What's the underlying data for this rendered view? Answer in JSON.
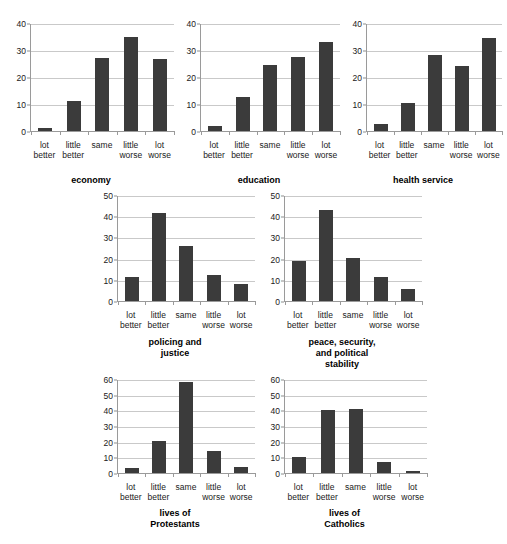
{
  "figure": {
    "background_color": "#ffffff",
    "bar_color": "#3b3b3b",
    "grid_color": "#c9c9c9",
    "axis_color": "#9a9a9a"
  },
  "chart_data": [
    {
      "id": "economy",
      "type": "bar",
      "title": "economy",
      "title_lines": [
        "economy"
      ],
      "categories": [
        "lot better",
        "little better",
        "same",
        "little worse",
        "lot worse"
      ],
      "category_lines": [
        [
          "lot",
          "better"
        ],
        [
          "little",
          "better"
        ],
        [
          "same"
        ],
        [
          "little",
          "worse"
        ],
        [
          "lot",
          "worse"
        ]
      ],
      "values": [
        1,
        11,
        27,
        35,
        26.5
      ],
      "xlabel": "",
      "ylabel": "",
      "ylim": [
        0,
        40
      ],
      "yticks": [
        0,
        10,
        20,
        30,
        40
      ],
      "grid": true,
      "legend": "none"
    },
    {
      "id": "education",
      "type": "bar",
      "title": "education",
      "title_lines": [
        "education"
      ],
      "categories": [
        "lot better",
        "little better",
        "same",
        "little worse",
        "lot worse"
      ],
      "category_lines": [
        [
          "lot",
          "better"
        ],
        [
          "little",
          "better"
        ],
        [
          "same"
        ],
        [
          "little",
          "worse"
        ],
        [
          "lot",
          "worse"
        ]
      ],
      "values": [
        2,
        12.5,
        24.5,
        27.5,
        33
      ],
      "xlabel": "",
      "ylabel": "",
      "ylim": [
        0,
        40
      ],
      "yticks": [
        0,
        10,
        20,
        30,
        40
      ],
      "grid": true,
      "legend": "none"
    },
    {
      "id": "health-service",
      "type": "bar",
      "title": "health service",
      "title_lines": [
        "health service"
      ],
      "categories": [
        "lot better",
        "little better",
        "same",
        "little worse",
        "lot worse"
      ],
      "category_lines": [
        [
          "lot",
          "better"
        ],
        [
          "little",
          "better"
        ],
        [
          "same"
        ],
        [
          "little",
          "worse"
        ],
        [
          "lot",
          "worse"
        ]
      ],
      "values": [
        2.5,
        10.5,
        28,
        24,
        34.5
      ],
      "xlabel": "",
      "ylabel": "",
      "ylim": [
        0,
        40
      ],
      "yticks": [
        0,
        10,
        20,
        30,
        40
      ],
      "grid": true,
      "legend": "none"
    },
    {
      "id": "policing-and-justice",
      "type": "bar",
      "title": "policing and justice",
      "title_lines": [
        "policing and",
        "justice"
      ],
      "categories": [
        "lot better",
        "little better",
        "same",
        "little worse",
        "lot worse"
      ],
      "category_lines": [
        [
          "lot",
          "better"
        ],
        [
          "little",
          "better"
        ],
        [
          "same"
        ],
        [
          "little",
          "worse"
        ],
        [
          "lot",
          "worse"
        ]
      ],
      "values": [
        11.5,
        41.5,
        26,
        12.5,
        8
      ],
      "xlabel": "",
      "ylabel": "",
      "ylim": [
        0,
        50
      ],
      "yticks": [
        0,
        10,
        20,
        30,
        40,
        50
      ],
      "grid": true,
      "legend": "none"
    },
    {
      "id": "peace-security-and-political-stability",
      "type": "bar",
      "title": "peace, security, and political stability",
      "title_lines": [
        "peace, security,",
        "and political",
        "stability"
      ],
      "categories": [
        "lot better",
        "little better",
        "same",
        "little worse",
        "lot worse"
      ],
      "category_lines": [
        [
          "lot",
          "better"
        ],
        [
          "little",
          "better"
        ],
        [
          "same"
        ],
        [
          "little",
          "worse"
        ],
        [
          "lot",
          "worse"
        ]
      ],
      "values": [
        19,
        43,
        20.5,
        11.5,
        5.5
      ],
      "xlabel": "",
      "ylabel": "",
      "ylim": [
        0,
        50
      ],
      "yticks": [
        0,
        10,
        20,
        30,
        40,
        50
      ],
      "grid": true,
      "legend": "none"
    },
    {
      "id": "lives-of-protestants",
      "type": "bar",
      "title": "lives of Protestants",
      "title_lines": [
        "lives of",
        "Protestants"
      ],
      "categories": [
        "lot better",
        "little better",
        "same",
        "little worse",
        "lot worse"
      ],
      "category_lines": [
        [
          "lot",
          "better"
        ],
        [
          "little",
          "better"
        ],
        [
          "same"
        ],
        [
          "little",
          "worse"
        ],
        [
          "lot",
          "worse"
        ]
      ],
      "values": [
        3,
        20.5,
        58,
        14,
        4
      ],
      "xlabel": "",
      "ylabel": "",
      "ylim": [
        0,
        60
      ],
      "yticks": [
        0,
        10,
        20,
        30,
        40,
        50,
        60
      ],
      "grid": true,
      "legend": "none"
    },
    {
      "id": "lives-of-catholics",
      "type": "bar",
      "title": "lives of Catholics",
      "title_lines": [
        "lives of",
        "Catholics"
      ],
      "categories": [
        "lot better",
        "little better",
        "same",
        "little worse",
        "lot worse"
      ],
      "category_lines": [
        [
          "lot",
          "better"
        ],
        [
          "little",
          "better"
        ],
        [
          "same"
        ],
        [
          "little",
          "worse"
        ],
        [
          "lot",
          "worse"
        ]
      ],
      "values": [
        10,
        40,
        41,
        7,
        1.5
      ],
      "xlabel": "",
      "ylabel": "",
      "ylim": [
        0,
        60
      ],
      "yticks": [
        0,
        10,
        20,
        30,
        40,
        50,
        60
      ],
      "grid": true,
      "legend": "none"
    }
  ],
  "layout": [
    {
      "id": "economy",
      "left": 8,
      "top": 24,
      "width": 166,
      "plotHeight": 108,
      "labelsTop": 140,
      "titleTop": 175
    },
    {
      "id": "education",
      "left": 178,
      "top": 24,
      "width": 162,
      "plotHeight": 108,
      "labelsTop": 140,
      "titleTop": 175
    },
    {
      "id": "health-service",
      "left": 344,
      "top": 24,
      "width": 158,
      "plotHeight": 108,
      "labelsTop": 140,
      "titleTop": 175
    },
    {
      "id": "policing-and-justice",
      "left": 95,
      "top": 196,
      "width": 160,
      "plotHeight": 106,
      "labelsTop": 310,
      "titleTop": 337
    },
    {
      "id": "peace-security-and-political-stability",
      "left": 262,
      "top": 196,
      "width": 160,
      "plotHeight": 106,
      "labelsTop": 310,
      "titleTop": 337
    },
    {
      "id": "lives-of-protestants",
      "left": 95,
      "top": 380,
      "width": 160,
      "plotHeight": 94,
      "labelsTop": 482,
      "titleTop": 508
    },
    {
      "id": "lives-of-catholics",
      "left": 262,
      "top": 380,
      "width": 165,
      "plotHeight": 94,
      "labelsTop": 482,
      "titleTop": 508
    }
  ]
}
